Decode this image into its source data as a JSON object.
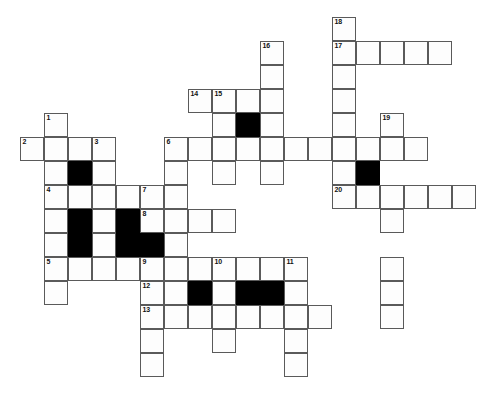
{
  "puzzle": {
    "title": "Crossword Grid",
    "type": "crossword",
    "grid": {
      "columns": 20,
      "rows": 16,
      "cell_size_px": 24,
      "origin_x_px": 20,
      "origin_y_px": 17,
      "white_color": "#fdfdfd",
      "black_color": "#000000",
      "border_color": "#5a5a5a",
      "background_color": "#ffffff"
    },
    "white_cells": [
      [
        13,
        0
      ],
      [
        10,
        1
      ],
      [
        13,
        1
      ],
      [
        14,
        1
      ],
      [
        15,
        1
      ],
      [
        16,
        1
      ],
      [
        17,
        1
      ],
      [
        10,
        2
      ],
      [
        13,
        2
      ],
      [
        7,
        3
      ],
      [
        8,
        3
      ],
      [
        9,
        3
      ],
      [
        10,
        3
      ],
      [
        13,
        3
      ],
      [
        1,
        4
      ],
      [
        7,
        3.5
      ],
      [
        13,
        4
      ],
      [
        1,
        4
      ],
      [
        9,
        4
      ],
      [
        10,
        4
      ],
      [
        13,
        4
      ],
      [
        15,
        4
      ],
      [
        0,
        5
      ],
      [
        1,
        5
      ],
      [
        2,
        5
      ],
      [
        3,
        5
      ],
      [
        6,
        5
      ],
      [
        7,
        5
      ],
      [
        8,
        5
      ],
      [
        9,
        5
      ],
      [
        10,
        5
      ],
      [
        11,
        5
      ],
      [
        12,
        5
      ],
      [
        13,
        5
      ],
      [
        14,
        5
      ],
      [
        15,
        5
      ],
      [
        16,
        5
      ],
      [
        1,
        6
      ],
      [
        2,
        6
      ],
      [
        3,
        6
      ],
      [
        6,
        6
      ],
      [
        9,
        6
      ],
      [
        10,
        6
      ],
      [
        13,
        6
      ],
      [
        15,
        6
      ],
      [
        1,
        7
      ],
      [
        2,
        7
      ],
      [
        3,
        7
      ],
      [
        4,
        7
      ],
      [
        5,
        7
      ],
      [
        6,
        7
      ],
      [
        13,
        7
      ],
      [
        14,
        7
      ],
      [
        15,
        7
      ],
      [
        16,
        7
      ],
      [
        17,
        7
      ],
      [
        18,
        7
      ],
      [
        1,
        8
      ],
      [
        3,
        8
      ],
      [
        5,
        8
      ],
      [
        6,
        8
      ],
      [
        7,
        8
      ],
      [
        8,
        8
      ],
      [
        15,
        8
      ],
      [
        1,
        8
      ],
      [
        3,
        8
      ],
      [
        6,
        8
      ],
      [
        15,
        9
      ],
      [
        1,
        9
      ],
      [
        3,
        9
      ],
      [
        6,
        9
      ],
      [
        15,
        9
      ],
      [
        1,
        10
      ],
      [
        2,
        10
      ],
      [
        3,
        10
      ],
      [
        4,
        10
      ],
      [
        5,
        10
      ],
      [
        6,
        10
      ],
      [
        7,
        10
      ],
      [
        8,
        10
      ],
      [
        9,
        10
      ],
      [
        10,
        10
      ],
      [
        11,
        10
      ],
      [
        15,
        10
      ],
      [
        1,
        11
      ],
      [
        5,
        11
      ],
      [
        6,
        11
      ],
      [
        8,
        11
      ],
      [
        11,
        11
      ],
      [
        15,
        11
      ],
      [
        5,
        12
      ],
      [
        6,
        12
      ],
      [
        7,
        12
      ],
      [
        8,
        12
      ],
      [
        9,
        12
      ],
      [
        10,
        12
      ],
      [
        11,
        12
      ],
      [
        12,
        12
      ],
      [
        5,
        13
      ],
      [
        8,
        13
      ],
      [
        11,
        13
      ],
      [
        5,
        14
      ],
      [
        11,
        14
      ]
    ],
    "cells": [
      {
        "c": 13,
        "r": 0,
        "state": "white",
        "number": "18"
      },
      {
        "c": 10,
        "r": 1,
        "state": "white",
        "number": "16"
      },
      {
        "c": 13,
        "r": 1,
        "state": "white",
        "number": "17n"
      },
      {
        "c": 14,
        "r": 1,
        "state": "white"
      },
      {
        "c": 15,
        "r": 1,
        "state": "white"
      },
      {
        "c": 16,
        "r": 1,
        "state": "white"
      },
      {
        "c": 17,
        "r": 1,
        "state": "white"
      },
      {
        "c": 10,
        "r": 2,
        "state": "white"
      },
      {
        "c": 13,
        "r": 2,
        "state": "white"
      },
      {
        "c": 7,
        "r": 3,
        "state": "white",
        "number": "14"
      },
      {
        "c": 8,
        "r": 3,
        "state": "white",
        "number": "15"
      },
      {
        "c": 9,
        "r": 3,
        "state": "white"
      },
      {
        "c": 10,
        "r": 3,
        "state": "white"
      },
      {
        "c": 13,
        "r": 3,
        "state": "white"
      },
      {
        "c": 1,
        "r": 4,
        "state": "white",
        "number": "1"
      },
      {
        "c": 8,
        "r": 4,
        "state": "white"
      },
      {
        "c": 9,
        "r": 4,
        "state": "black"
      },
      {
        "c": 10,
        "r": 4,
        "state": "white"
      },
      {
        "c": 13,
        "r": 4,
        "state": "white"
      },
      {
        "c": 15,
        "r": 4,
        "state": "white",
        "number": "19"
      },
      {
        "c": 0,
        "r": 5,
        "state": "white",
        "number": "2"
      },
      {
        "c": 1,
        "r": 5,
        "state": "white"
      },
      {
        "c": 2,
        "r": 5,
        "state": "white"
      },
      {
        "c": 3,
        "r": 5,
        "state": "white",
        "number": "3"
      },
      {
        "c": 6,
        "r": 5,
        "state": "white",
        "number": "6"
      },
      {
        "c": 7,
        "r": 5,
        "state": "white"
      },
      {
        "c": 8,
        "r": 5,
        "state": "white"
      },
      {
        "c": 9,
        "r": 5,
        "state": "white"
      },
      {
        "c": 10,
        "r": 5,
        "state": "white"
      },
      {
        "c": 11,
        "r": 5,
        "state": "white"
      },
      {
        "c": 12,
        "r": 5,
        "state": "white"
      },
      {
        "c": 13,
        "r": 5,
        "state": "white"
      },
      {
        "c": 14,
        "r": 5,
        "state": "white"
      },
      {
        "c": 15,
        "r": 5,
        "state": "white"
      },
      {
        "c": 16,
        "r": 5,
        "state": "white"
      },
      {
        "c": 1,
        "r": 6,
        "state": "white"
      },
      {
        "c": 2,
        "r": 6,
        "state": "black"
      },
      {
        "c": 3,
        "r": 6,
        "state": "white"
      },
      {
        "c": 6,
        "r": 6,
        "state": "white"
      },
      {
        "c": 8,
        "r": 6,
        "state": "white"
      },
      {
        "c": 10,
        "r": 6,
        "state": "white"
      },
      {
        "c": 13,
        "r": 6,
        "state": "white"
      },
      {
        "c": 14,
        "r": 6,
        "state": "black"
      },
      {
        "c": 1,
        "r": 7,
        "state": "white",
        "number": "4"
      },
      {
        "c": 2,
        "r": 7,
        "state": "white"
      },
      {
        "c": 3,
        "r": 7,
        "state": "white"
      },
      {
        "c": 4,
        "r": 7,
        "state": "white"
      },
      {
        "c": 5,
        "r": 7,
        "state": "white",
        "number": "7"
      },
      {
        "c": 6,
        "r": 7,
        "state": "white"
      },
      {
        "c": 13,
        "r": 7,
        "state": "white",
        "number": "20"
      },
      {
        "c": 14,
        "r": 7,
        "state": "white"
      },
      {
        "c": 15,
        "r": 7,
        "state": "white"
      },
      {
        "c": 16,
        "r": 7,
        "state": "white"
      },
      {
        "c": 17,
        "r": 7,
        "state": "white"
      },
      {
        "c": 18,
        "r": 7,
        "state": "white"
      },
      {
        "c": 1,
        "r": 8,
        "state": "white"
      },
      {
        "c": 2,
        "r": 8,
        "state": "black"
      },
      {
        "c": 3,
        "r": 8,
        "state": "white"
      },
      {
        "c": 4,
        "r": 8,
        "state": "black"
      },
      {
        "c": 5,
        "r": 8,
        "state": "white",
        "number": "8"
      },
      {
        "c": 6,
        "r": 8,
        "state": "white"
      },
      {
        "c": 7,
        "r": 8,
        "state": "white"
      },
      {
        "c": 8,
        "r": 8,
        "state": "white"
      },
      {
        "c": 15,
        "r": 8,
        "state": "white"
      },
      {
        "c": 1,
        "r": 9,
        "state": "white"
      },
      {
        "c": 2,
        "r": 9,
        "state": "black"
      },
      {
        "c": 3,
        "r": 9,
        "state": "white"
      },
      {
        "c": 4,
        "r": 9,
        "state": "black"
      },
      {
        "c": 5,
        "r": 9,
        "state": "black"
      },
      {
        "c": 6,
        "r": 9,
        "state": "white"
      },
      {
        "c": 1,
        "r": 10,
        "state": "white",
        "number": "5"
      },
      {
        "c": 2,
        "r": 10,
        "state": "white"
      },
      {
        "c": 3,
        "r": 10,
        "state": "white"
      },
      {
        "c": 4,
        "r": 10,
        "state": "white"
      },
      {
        "c": 5,
        "r": 10,
        "state": "white",
        "number": "9"
      },
      {
        "c": 6,
        "r": 10,
        "state": "white"
      },
      {
        "c": 7,
        "r": 10,
        "state": "white"
      },
      {
        "c": 8,
        "r": 10,
        "state": "white",
        "number": "10"
      },
      {
        "c": 9,
        "r": 10,
        "state": "white"
      },
      {
        "c": 10,
        "r": 10,
        "state": "white"
      },
      {
        "c": 11,
        "r": 10,
        "state": "white",
        "number": "11"
      },
      {
        "c": 15,
        "r": 10,
        "state": "white"
      },
      {
        "c": 1,
        "r": 11,
        "state": "white"
      },
      {
        "c": 5,
        "r": 11,
        "state": "white",
        "number": "12"
      },
      {
        "c": 6,
        "r": 11,
        "state": "white"
      },
      {
        "c": 7,
        "r": 11,
        "state": "black"
      },
      {
        "c": 8,
        "r": 11,
        "state": "white"
      },
      {
        "c": 9,
        "r": 11,
        "state": "black"
      },
      {
        "c": 10,
        "r": 11,
        "state": "black"
      },
      {
        "c": 11,
        "r": 11,
        "state": "white"
      },
      {
        "c": 15,
        "r": 11,
        "state": "white"
      },
      {
        "c": 5,
        "r": 12,
        "state": "white",
        "number": "13"
      },
      {
        "c": 6,
        "r": 12,
        "state": "white"
      },
      {
        "c": 7,
        "r": 12,
        "state": "white"
      },
      {
        "c": 8,
        "r": 12,
        "state": "white"
      },
      {
        "c": 9,
        "r": 12,
        "state": "white"
      },
      {
        "c": 10,
        "r": 12,
        "state": "white"
      },
      {
        "c": 11,
        "r": 12,
        "state": "white"
      },
      {
        "c": 12,
        "r": 12,
        "state": "white"
      },
      {
        "c": 15,
        "r": 12,
        "state": "white"
      },
      {
        "c": 5,
        "r": 13,
        "state": "white"
      },
      {
        "c": 8,
        "r": 13,
        "state": "white"
      },
      {
        "c": 11,
        "r": 13,
        "state": "white"
      },
      {
        "c": 5,
        "r": 14,
        "state": "white"
      },
      {
        "c": 11,
        "r": 14,
        "state": "white"
      }
    ],
    "numbers": [
      "1",
      "2",
      "3",
      "4",
      "5",
      "6",
      "7",
      "8",
      "9",
      "10",
      "11",
      "12",
      "13",
      "14",
      "15",
      "16",
      "17",
      "18",
      "19",
      "20"
    ]
  }
}
